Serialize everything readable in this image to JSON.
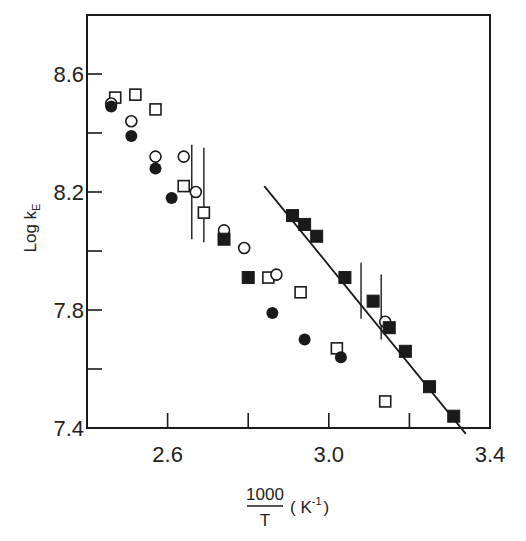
{
  "chart_data": {
    "type": "scatter",
    "title": "",
    "xlabel": "1000/T (K^-1)",
    "xlabel_parts": {
      "numerator": "1000",
      "denominator": "T",
      "unit_open": "( K",
      "unit_exp": "-1",
      "unit_close": ")"
    },
    "ylabel": "Log k_E",
    "ylabel_parts": {
      "main": "Log k",
      "subscript": "E"
    },
    "xlim": [
      2.4,
      3.4
    ],
    "ylim": [
      7.4,
      8.8
    ],
    "x_ticks": [
      2.6,
      2.8,
      3.0,
      3.2
    ],
    "x_tick_labels": [
      {
        "value": 2.6,
        "label": "2.6"
      },
      {
        "value": 3.0,
        "label": "3.0"
      },
      {
        "value": 3.4,
        "label": "3.4"
      }
    ],
    "y_ticks": [
      7.6,
      7.8,
      8.0,
      8.2,
      8.4,
      8.6
    ],
    "y_tick_labels": [
      {
        "value": 7.4,
        "label": "7.4"
      },
      {
        "value": 7.8,
        "label": "7.8"
      },
      {
        "value": 8.2,
        "label": "8.2"
      },
      {
        "value": 8.6,
        "label": "8.6"
      }
    ],
    "grid": false,
    "legend": null,
    "series": [
      {
        "name": "open squares",
        "marker": "square-open",
        "points": [
          [
            2.47,
            8.52
          ],
          [
            2.52,
            8.53
          ],
          [
            2.57,
            8.48
          ],
          [
            2.64,
            8.22
          ],
          [
            2.69,
            8.13
          ],
          [
            2.85,
            7.91
          ],
          [
            2.93,
            7.86
          ],
          [
            3.02,
            7.67
          ],
          [
            3.14,
            7.49
          ]
        ]
      },
      {
        "name": "open circles",
        "marker": "circle-open",
        "points": [
          [
            2.46,
            8.5
          ],
          [
            2.51,
            8.44
          ],
          [
            2.57,
            8.32
          ],
          [
            2.64,
            8.32
          ],
          [
            2.67,
            8.2
          ],
          [
            2.74,
            8.07
          ],
          [
            2.79,
            8.01
          ],
          [
            2.87,
            7.92
          ],
          [
            3.14,
            7.76
          ]
        ]
      },
      {
        "name": "filled circles",
        "marker": "circle-filled",
        "points": [
          [
            2.46,
            8.49
          ],
          [
            2.51,
            8.39
          ],
          [
            2.57,
            8.28
          ],
          [
            2.61,
            8.18
          ],
          [
            2.86,
            7.79
          ],
          [
            2.94,
            7.7
          ],
          [
            3.03,
            7.64
          ]
        ]
      },
      {
        "name": "filled squares",
        "marker": "square-filled",
        "points": [
          [
            2.74,
            8.04
          ],
          [
            2.8,
            7.91
          ],
          [
            2.91,
            8.12
          ],
          [
            2.94,
            8.09
          ],
          [
            2.97,
            8.05
          ],
          [
            3.04,
            7.91
          ],
          [
            3.11,
            7.83
          ],
          [
            3.15,
            7.74
          ],
          [
            3.19,
            7.66
          ],
          [
            3.25,
            7.54
          ],
          [
            3.31,
            7.44
          ]
        ]
      }
    ],
    "fit_line": {
      "x": [
        2.84,
        3.34
      ],
      "y": [
        8.22,
        7.38
      ]
    },
    "error_bars": [
      {
        "x": 2.66,
        "y_low": 8.04,
        "y_high": 8.36
      },
      {
        "x": 2.69,
        "y_low": 8.03,
        "y_high": 8.35
      },
      {
        "x": 3.08,
        "y_low": 7.77,
        "y_high": 7.96
      },
      {
        "x": 3.13,
        "y_low": 7.7,
        "y_high": 7.92
      }
    ]
  },
  "style": {
    "ink": "#1a1a1a",
    "background": "#ffffff"
  }
}
